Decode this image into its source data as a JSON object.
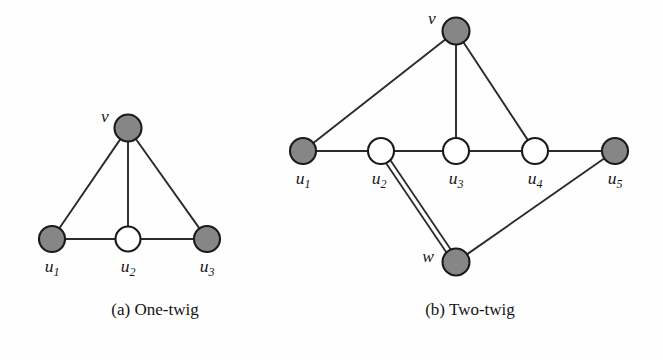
{
  "figure": {
    "background_color": "#fefefe",
    "node_fill_color": "#868686",
    "node_open_color": "#ffffff",
    "edge_color": "#2b2b2b",
    "subfigures": [
      {
        "id": "a",
        "caption": "(a) One-twig",
        "caption_x": 155,
        "caption_y": 315,
        "nodes": [
          {
            "id": "v",
            "label": "v",
            "sub": "",
            "cx": 128,
            "cy": 128,
            "r": 13.5,
            "style": "filled",
            "label_x": 105,
            "label_y": 122,
            "anchor": "middle"
          },
          {
            "id": "u1",
            "label": "u",
            "sub": "1",
            "cx": 52,
            "cy": 239,
            "r": 13.0,
            "style": "filled",
            "label_x": 52,
            "label_y": 272,
            "anchor": "middle"
          },
          {
            "id": "u2",
            "label": "u",
            "sub": "2",
            "cx": 128,
            "cy": 239,
            "r": 12.5,
            "style": "open",
            "label_x": 128,
            "label_y": 272,
            "anchor": "middle"
          },
          {
            "id": "u3",
            "label": "u",
            "sub": "3",
            "cx": 207,
            "cy": 239,
            "r": 13.0,
            "style": "filled",
            "label_x": 207,
            "label_y": 272,
            "anchor": "middle"
          }
        ],
        "edges": [
          {
            "from": "v",
            "to": "u1",
            "double": false
          },
          {
            "from": "v",
            "to": "u2",
            "double": false
          },
          {
            "from": "v",
            "to": "u3",
            "double": false
          },
          {
            "from": "u1",
            "to": "u2",
            "double": false
          },
          {
            "from": "u2",
            "to": "u3",
            "double": false
          }
        ]
      },
      {
        "id": "b",
        "caption": "(b) Two-twig",
        "caption_x": 470,
        "caption_y": 315,
        "nodes": [
          {
            "id": "v",
            "label": "v",
            "sub": "",
            "cx": 456,
            "cy": 31,
            "r": 13.5,
            "style": "filled",
            "label_x": 432,
            "label_y": 24,
            "anchor": "middle"
          },
          {
            "id": "u1",
            "label": "u",
            "sub": "1",
            "cx": 303,
            "cy": 151,
            "r": 13.0,
            "style": "filled",
            "label_x": 303,
            "label_y": 184,
            "anchor": "middle"
          },
          {
            "id": "u2",
            "label": "u",
            "sub": "2",
            "cx": 381,
            "cy": 151,
            "r": 13.0,
            "style": "open",
            "label_x": 379,
            "label_y": 184,
            "anchor": "middle"
          },
          {
            "id": "u3",
            "label": "u",
            "sub": "3",
            "cx": 456,
            "cy": 151,
            "r": 13.0,
            "style": "open",
            "label_x": 456,
            "label_y": 184,
            "anchor": "middle"
          },
          {
            "id": "u4",
            "label": "u",
            "sub": "4",
            "cx": 535,
            "cy": 151,
            "r": 13.0,
            "style": "open",
            "label_x": 535,
            "label_y": 184,
            "anchor": "middle"
          },
          {
            "id": "u5",
            "label": "u",
            "sub": "5",
            "cx": 615,
            "cy": 151,
            "r": 13.0,
            "style": "filled",
            "label_x": 615,
            "label_y": 184,
            "anchor": "middle"
          },
          {
            "id": "w",
            "label": "w",
            "sub": "",
            "cx": 456,
            "cy": 262,
            "r": 13.5,
            "style": "filled",
            "label_x": 428,
            "label_y": 262,
            "anchor": "middle"
          }
        ],
        "edges": [
          {
            "from": "v",
            "to": "u1",
            "double": false
          },
          {
            "from": "v",
            "to": "u3",
            "double": false
          },
          {
            "from": "v",
            "to": "u4",
            "double": false
          },
          {
            "from": "u1",
            "to": "u2",
            "double": false
          },
          {
            "from": "u2",
            "to": "u3",
            "double": false
          },
          {
            "from": "u3",
            "to": "u4",
            "double": false
          },
          {
            "from": "u4",
            "to": "u5",
            "double": false
          },
          {
            "from": "u2",
            "to": "w",
            "double": true
          },
          {
            "from": "u5",
            "to": "w",
            "double": false
          }
        ]
      }
    ]
  }
}
